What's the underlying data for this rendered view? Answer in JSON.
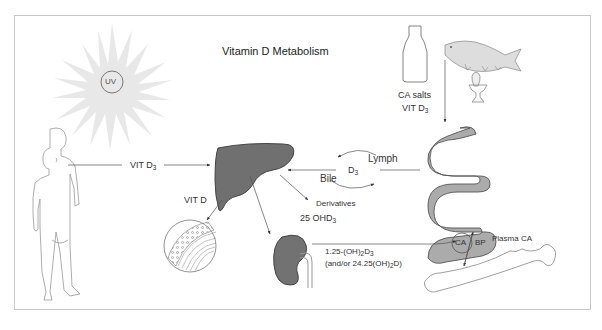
{
  "title": "Vitamin D Metabolism",
  "sun": {
    "label": "UV"
  },
  "food": {
    "line1": "CA salts",
    "line2_main": "VIT D",
    "line2_sub": "3"
  },
  "skin_to_liver": {
    "main": "VIT D",
    "sub": "3"
  },
  "liver_to_tissue": {
    "label": "VIT D"
  },
  "gut_cycle": {
    "lymph": "Lymph",
    "bile": "Bile",
    "d3_main": "D",
    "d3_sub": "3"
  },
  "derivatives": {
    "label": "Derivatives"
  },
  "ohd3": {
    "main": "25 OHD",
    "sub": "3"
  },
  "kidney_product": {
    "line1_a": "1.25-(OH)",
    "line1_sub1": "2",
    "line1_b": "D",
    "line1_sub2": "3",
    "line2_a": "(and/or 24.25(OH)",
    "line2_sub": "2",
    "line2_b": "D)"
  },
  "intestine": {
    "ca": "CA",
    "bp": "BP"
  },
  "plasma": {
    "label": "Plasma CA"
  },
  "colors": {
    "organ": "#6f6f6f",
    "intestine": "#a9a9a9",
    "sun": "#e6e6e6",
    "line": "#555555"
  }
}
